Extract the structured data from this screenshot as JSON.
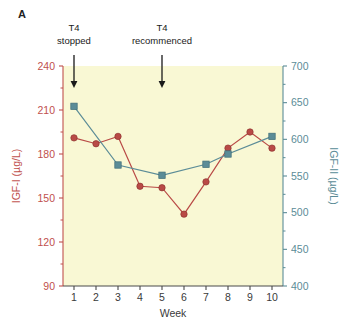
{
  "figure": {
    "panel_label": "A"
  },
  "chart_data": {
    "type": "line",
    "title": "",
    "xlabel": "Week",
    "x": [
      1,
      2,
      3,
      4,
      5,
      6,
      7,
      8,
      9,
      10
    ],
    "xticklabels": [
      "1",
      "2",
      "3",
      "4",
      "5",
      "6",
      "7",
      "8",
      "9",
      "10"
    ],
    "xlim": [
      0.5,
      10.5
    ],
    "grid": false,
    "legend_position": "none",
    "plot_background_color": "#f9f8d4",
    "axes": {
      "left": {
        "label": "IGF-I (µg/L)",
        "ylim": [
          90,
          240
        ],
        "ticks": [
          90,
          120,
          150,
          180,
          210,
          240
        ],
        "ticklabels": [
          "90",
          "120",
          "150",
          "180",
          "210",
          "240"
        ],
        "color": "#c0504d"
      },
      "right": {
        "label": "IGF-II (µg/L)",
        "ylim": [
          400,
          700
        ],
        "ticks": [
          400,
          450,
          500,
          550,
          600,
          650,
          700
        ],
        "ticklabels": [
          "400",
          "450",
          "500",
          "550",
          "600",
          "650",
          "700"
        ],
        "color": "#5b8c97"
      }
    },
    "series": [
      {
        "name": "IGF-I",
        "axis": "left",
        "color": "#b94a46",
        "marker": "circle",
        "values": [
          191,
          187,
          192,
          158,
          157,
          139,
          161,
          184,
          195,
          184
        ]
      },
      {
        "name": "IGF-II",
        "axis": "right",
        "color": "#5b8c97",
        "marker": "square",
        "x": [
          1,
          3,
          5,
          7,
          8,
          10
        ],
        "values": [
          645,
          565,
          551,
          566,
          580,
          604
        ]
      }
    ],
    "annotations": [
      {
        "text_line1": "T4",
        "text_line2": "stopped",
        "x": 1,
        "arrow": true
      },
      {
        "text_line1": "T4",
        "text_line2": "recommenced",
        "x": 5,
        "arrow": true
      }
    ]
  }
}
